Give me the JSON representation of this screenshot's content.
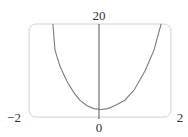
{
  "chart_data": {
    "type": "line",
    "title": "",
    "xlabel": "",
    "ylabel": "",
    "xlim": [
      -2,
      2
    ],
    "ylim": [
      -1,
      20
    ],
    "grid": false,
    "legend": null,
    "tick_labels": {
      "x_left": "−2",
      "x_center": "0",
      "x_right": "2",
      "y_top": "20"
    },
    "series": [
      {
        "name": "f(x)",
        "x": [
          -1.3,
          -1.24,
          -1.1,
          -0.9,
          -0.7,
          -0.54,
          -0.35,
          -0.15,
          0.05,
          0.25,
          0.45,
          0.73,
          1.0,
          1.3,
          1.55,
          1.75
        ],
        "y": [
          20,
          14.1,
          10.5,
          7.0,
          4.4,
          2.8,
          1.6,
          0.9,
          0.7,
          0.9,
          1.6,
          2.8,
          5.2,
          9.5,
          14.1,
          20
        ]
      }
    ]
  },
  "colors": {
    "frame": "#d0d0d0",
    "axis": "#555555",
    "curve": "#7a7a7a",
    "text": "#333333"
  }
}
